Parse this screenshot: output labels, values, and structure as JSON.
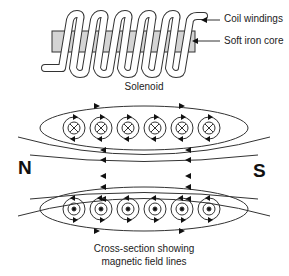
{
  "solenoid": {
    "title": "Solenoid",
    "labels": {
      "coil": "Coil windings",
      "core": "Soft iron core"
    },
    "turns": 6,
    "core_color": "#d4d4d4"
  },
  "cross_section": {
    "caption_line1": "Cross-section showing",
    "caption_line2": "magnetic field lines",
    "poles": {
      "left": "N",
      "right": "S"
    },
    "top_row": {
      "symbol": "cross",
      "meaning": "current into page",
      "count": 6
    },
    "bottom_row": {
      "symbol": "dot",
      "meaning": "current out of page",
      "count": 6
    }
  }
}
